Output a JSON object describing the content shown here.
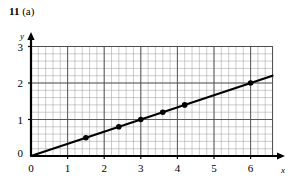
{
  "figure": {
    "label_number": "11",
    "label_part": "(a)"
  },
  "chart_data": {
    "type": "scatter",
    "title": "11 (a)",
    "xlabel": "x",
    "ylabel": "y",
    "xlim": [
      0,
      6.7
    ],
    "ylim": [
      0,
      3
    ],
    "xticks": [
      0,
      1,
      2,
      3,
      4,
      5,
      6
    ],
    "xticklabels": [
      "0",
      "1",
      "2",
      "3",
      "4",
      "5",
      "6"
    ],
    "yticks": [
      0,
      1,
      2,
      3
    ],
    "yticklabels": [
      "0",
      "1",
      "2",
      "3"
    ],
    "grid": "minor-and-major",
    "minor_grid_step": 0.2,
    "major_grid_step": 1,
    "legend": "none",
    "series": [
      {
        "name": "plotted points",
        "marker": "filled-circle",
        "x": [
          1.5,
          2.4,
          3.0,
          3.6,
          4.2,
          6.0
        ],
        "y": [
          0.5,
          0.8,
          1.0,
          1.2,
          1.4,
          2.0
        ]
      },
      {
        "name": "line of best fit",
        "type": "line",
        "from": [
          0,
          0
        ],
        "to": [
          6.6,
          2.2
        ],
        "slope": 0.3333,
        "intercept": 0
      }
    ],
    "colors": {
      "line": "#000000",
      "marker": "#000000",
      "axis": "#000000",
      "minor_grid": "#9a9a9a",
      "major_grid": "#4d4d4d",
      "background": "#ffffff"
    }
  }
}
